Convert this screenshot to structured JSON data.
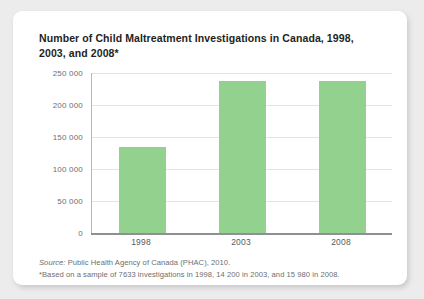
{
  "card": {
    "title": "Number of Child Maltreatment Investigations in Canada, 1998, 2003, and 2008*",
    "source_label": "Source:",
    "source_text": " Public Health Agency of Canada (PHAC), 2010.",
    "footnote": "*Based on a sample of 7633 investigations in 1998, 14 200 in 2003, and 15 980 in 2008."
  },
  "colors": {
    "bar_fill": "#93d18f",
    "card_background": "#ffffff",
    "page_background": "#ececed",
    "gridline": "#e3e4e6",
    "axis": "#8e9095",
    "title_text": "#231f20",
    "label_text": "#6d6e71"
  },
  "chart_data": {
    "type": "bar",
    "title": "Number of Child Maltreatment Investigations in Canada, 1998, 2003, and 2008*",
    "categories": [
      "1998",
      "2003",
      "2008"
    ],
    "values": [
      134500,
      237500,
      237000
    ],
    "series": [
      {
        "name": "Child maltreatment investigations",
        "values": [
          134500,
          237500,
          237000
        ]
      }
    ],
    "xlabel": "",
    "ylabel": "",
    "ylim": [
      0,
      250000
    ],
    "yticks": [
      0,
      50000,
      100000,
      150000,
      200000,
      250000
    ],
    "ytick_labels": [
      "0",
      "50 000",
      "100 000",
      "150 000",
      "200 000",
      "250 000"
    ],
    "grid": true,
    "legend": false,
    "bar_color": "#93d18f"
  }
}
